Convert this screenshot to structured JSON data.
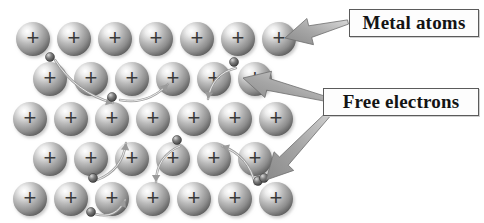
{
  "figure": {
    "background_color": "#ffffff",
    "width": 484,
    "height": 223
  },
  "labels": {
    "metal_atoms": "Metal atoms",
    "free_electrons": "Free electrons"
  },
  "colors": {
    "ion_highlight": "#f2f2f2",
    "ion_mid": "#a8a8a8",
    "ion_dark": "#4f4f4f",
    "electron_dark": "#3d3d3d",
    "arrow_gray": "#8f8f8f",
    "motion_arrow": "#9a9a9a",
    "label_border": "#5b5b5b",
    "label_text": "#141414"
  },
  "ion_symbol": "+",
  "lattice": {
    "ion_radius": 17,
    "rows": [
      {
        "y": 39,
        "xs": [
          33,
          74,
          115,
          156,
          197,
          238,
          279
        ]
      },
      {
        "y": 79,
        "xs": [
          50,
          91,
          132,
          173,
          214,
          255
        ]
      },
      {
        "y": 119,
        "xs": [
          30,
          71,
          112,
          153,
          194,
          235,
          276
        ]
      },
      {
        "y": 159,
        "xs": [
          50,
          91,
          132,
          173,
          214,
          255
        ]
      },
      {
        "y": 199,
        "xs": [
          30,
          71,
          112,
          153,
          194,
          235,
          276
        ]
      }
    ]
  },
  "free_electrons": [
    {
      "x": 50,
      "y": 57,
      "r": 4.5
    },
    {
      "x": 112,
      "y": 97,
      "r": 4.5
    },
    {
      "x": 234,
      "y": 62,
      "r": 4.5
    },
    {
      "x": 93,
      "y": 178,
      "r": 4.5
    },
    {
      "x": 177,
      "y": 140,
      "r": 4.5
    },
    {
      "x": 258,
      "y": 181,
      "r": 4.5
    },
    {
      "x": 91,
      "y": 212,
      "r": 4.5
    },
    {
      "x": 264,
      "y": 178,
      "r": 4.5
    }
  ],
  "motion_arrows": [
    {
      "from": [
        55,
        60
      ],
      "to": [
        113,
        103
      ],
      "desc": "electron-drift-arrow-1"
    },
    {
      "from": [
        120,
        100
      ],
      "to": [
        168,
        84
      ],
      "desc": "electron-drift-arrow-2"
    },
    {
      "from": [
        236,
        68
      ],
      "to": [
        208,
        99
      ],
      "desc": "electron-drift-arrow-3"
    },
    {
      "from": [
        97,
        180
      ],
      "to": [
        126,
        143
      ],
      "desc": "electron-drift-arrow-4"
    },
    {
      "from": [
        180,
        146
      ],
      "to": [
        156,
        182
      ],
      "desc": "electron-drift-arrow-5"
    },
    {
      "from": [
        255,
        184
      ],
      "to": [
        222,
        146
      ],
      "desc": "electron-drift-arrow-6"
    },
    {
      "from": [
        95,
        214
      ],
      "to": [
        125,
        200
      ],
      "desc": "electron-drift-arrow-7"
    }
  ],
  "callout_arrows": [
    {
      "name": "metal-atoms-arrow",
      "tail": [
        348,
        22
      ],
      "head": [
        285,
        38
      ]
    },
    {
      "name": "free-electrons-arrow-up",
      "tail": [
        330,
        100
      ],
      "head": [
        243,
        78
      ]
    },
    {
      "name": "free-electrons-arrow-down",
      "tail": [
        336,
        106
      ],
      "head": [
        266,
        180
      ]
    }
  ]
}
